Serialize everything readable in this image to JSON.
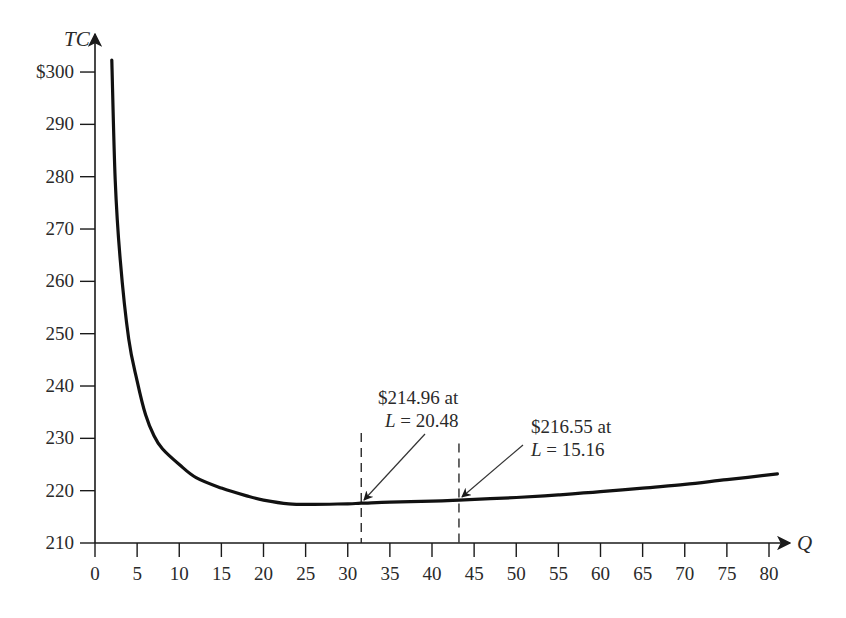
{
  "chart_data": {
    "type": "line",
    "title": "",
    "xlabel": "Q",
    "ylabel": "TC",
    "xlim": [
      0,
      82
    ],
    "ylim": [
      210,
      304
    ],
    "grid": false,
    "legend": null,
    "x_ticks": [
      0,
      5,
      10,
      15,
      20,
      25,
      30,
      35,
      40,
      45,
      50,
      55,
      60,
      65,
      70,
      75,
      80
    ],
    "x_tick_labels": [
      "0",
      "5",
      "10",
      "15",
      "20",
      "25",
      "30",
      "35",
      "40",
      "45",
      "50",
      "55",
      "60",
      "65",
      "70",
      "75",
      "80"
    ],
    "y_ticks": [
      210,
      220,
      230,
      240,
      250,
      260,
      270,
      280,
      290,
      300
    ],
    "y_tick_labels": [
      "210",
      "220",
      "230",
      "240",
      "250",
      "260",
      "270",
      "280",
      "290",
      "$300"
    ],
    "series": [
      {
        "name": "TC",
        "color": "#111111",
        "x": [
          2,
          2.4,
          3,
          4,
          5,
          6,
          7,
          8,
          10,
          12,
          15,
          18,
          20,
          23,
          26,
          30,
          31.6,
          35,
          40,
          43.2,
          50,
          55,
          60,
          65,
          70,
          75,
          81
        ],
        "y": [
          302.3,
          279.4,
          264,
          249,
          241,
          234.5,
          230.5,
          228,
          225,
          222.5,
          220.5,
          219,
          218.2,
          217.5,
          217.4,
          217.5,
          217.6,
          217.8,
          218.0,
          218.2,
          218.7,
          219.2,
          219.8,
          220.5,
          221.2,
          222.1,
          223.2
        ]
      }
    ],
    "reference_lines": [
      {
        "orientation": "vertical",
        "x": 31.6,
        "style": "dashed",
        "y_top": 231
      },
      {
        "orientation": "vertical",
        "x": 43.2,
        "style": "dashed",
        "y_top": 229
      }
    ],
    "annotations": [
      {
        "line1": "$214.96 at",
        "line2_var": "L",
        "line2_rest": " = 20.48",
        "points_to": {
          "x": 31.6,
          "y": 217.6
        }
      },
      {
        "line1": "$216.55 at",
        "line2_var": "L",
        "line2_rest": " = 15.16",
        "points_to": {
          "x": 43.2,
          "y": 218.2
        }
      }
    ]
  }
}
